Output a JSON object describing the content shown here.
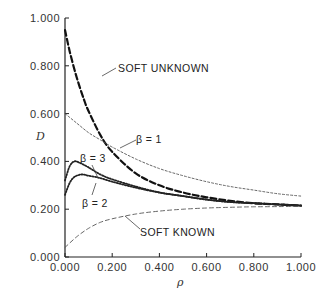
{
  "chart_data": {
    "type": "line",
    "title": "",
    "xlabel": "ρ",
    "ylabel": "D",
    "xlim": [
      0,
      1
    ],
    "ylim": [
      0,
      1
    ],
    "x_ticks": [
      "0.000",
      "0.200",
      "0.400",
      "0.600",
      "0.800",
      "1.000"
    ],
    "y_ticks": [
      "0.000",
      "0.200",
      "0.400",
      "0.600",
      "0.800",
      "1.000"
    ],
    "grid": false,
    "legend": "none (curves labeled inline)",
    "series": [
      {
        "name": "SOFT UNKNOWN",
        "style": "heavy-dashed",
        "x": [
          0.0,
          0.02,
          0.05,
          0.08,
          0.1,
          0.15,
          0.2,
          0.3,
          0.4,
          0.5,
          0.6,
          0.7,
          0.8,
          0.9,
          1.0
        ],
        "y": [
          0.95,
          0.86,
          0.75,
          0.66,
          0.61,
          0.51,
          0.44,
          0.35,
          0.3,
          0.27,
          0.25,
          0.235,
          0.225,
          0.22,
          0.215
        ]
      },
      {
        "name": "β = 1",
        "style": "fine-dotted",
        "x": [
          0.0,
          0.05,
          0.1,
          0.15,
          0.2,
          0.3,
          0.4,
          0.5,
          0.6,
          0.7,
          0.8,
          0.9,
          1.0
        ],
        "y": [
          0.6,
          0.56,
          0.52,
          0.49,
          0.46,
          0.41,
          0.37,
          0.34,
          0.315,
          0.295,
          0.28,
          0.265,
          0.255
        ]
      },
      {
        "name": "β = 3",
        "style": "dotted",
        "x": [
          0.0,
          0.02,
          0.04,
          0.06,
          0.1,
          0.15,
          0.2,
          0.3,
          0.4,
          0.5,
          0.6,
          0.7,
          0.8,
          0.9,
          1.0
        ],
        "y": [
          0.32,
          0.38,
          0.4,
          0.395,
          0.375,
          0.345,
          0.325,
          0.295,
          0.27,
          0.255,
          0.24,
          0.23,
          0.225,
          0.22,
          0.215
        ]
      },
      {
        "name": "β = 2",
        "style": "dotted",
        "x": [
          0.0,
          0.02,
          0.04,
          0.07,
          0.1,
          0.15,
          0.2,
          0.3,
          0.4,
          0.5,
          0.6,
          0.7,
          0.8,
          0.9,
          1.0
        ],
        "y": [
          0.26,
          0.31,
          0.335,
          0.345,
          0.34,
          0.33,
          0.315,
          0.29,
          0.27,
          0.255,
          0.24,
          0.23,
          0.225,
          0.22,
          0.215
        ]
      },
      {
        "name": "SOFT KNOWN",
        "style": "thin-dashed",
        "x": [
          0.0,
          0.05,
          0.1,
          0.15,
          0.2,
          0.3,
          0.4,
          0.5,
          0.6,
          0.7,
          0.8,
          0.9,
          1.0
        ],
        "y": [
          0.04,
          0.085,
          0.12,
          0.145,
          0.16,
          0.18,
          0.192,
          0.2,
          0.205,
          0.208,
          0.21,
          0.211,
          0.212
        ]
      }
    ],
    "annotations": [
      {
        "text": "SOFT UNKNOWN",
        "target": "SOFT UNKNOWN"
      },
      {
        "text": "β = 1",
        "target": "β = 1"
      },
      {
        "text": "β = 3",
        "target": "β = 3"
      },
      {
        "text": "β = 2",
        "target": "β = 2"
      },
      {
        "text": "SOFT KNOWN",
        "target": "SOFT KNOWN"
      }
    ]
  },
  "labels": {
    "y_axis": "D",
    "x_axis": "ρ",
    "soft_unknown": "SOFT UNKNOWN",
    "beta1": "β = 1",
    "beta3": "β = 3",
    "beta2": "β = 2",
    "soft_known": "SOFT KNOWN"
  },
  "ticks": {
    "x": [
      "0.000",
      "0.200",
      "0.400",
      "0.600",
      "0.800",
      "1.000"
    ],
    "y": [
      "0.000",
      "0.200",
      "0.400",
      "0.600",
      "0.800",
      "1.000"
    ]
  }
}
